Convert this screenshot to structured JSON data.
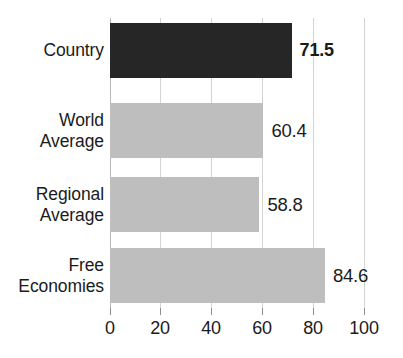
{
  "chart_data": {
    "type": "bar",
    "orientation": "horizontal",
    "title": "",
    "subtitle": "",
    "xlabel": "",
    "ylabel": "",
    "xlim": [
      0,
      100
    ],
    "grid": true,
    "legend": "none",
    "categories": [
      "Country",
      "World\nAverage",
      "Regional\nAverage",
      "Free\nEconomies"
    ],
    "values": [
      71.5,
      60.4,
      58.8,
      84.6
    ],
    "value_labels": [
      "71.5",
      "60.4",
      "58.8",
      "84.6"
    ],
    "tick_values": [
      0,
      20,
      40,
      60,
      80,
      100
    ],
    "tick_labels": [
      "0",
      "20",
      "40",
      "60",
      "80",
      "100"
    ],
    "bar_colors": [
      "#262626",
      "#bebebe",
      "#bebebe",
      "#bebebe"
    ],
    "highlight_index": 0,
    "colors": {
      "highlight_bar": "#262626",
      "comparison_bar": "#bebebe",
      "gridline": "#d3d3d3",
      "axis_tick": "#8d8d8d",
      "text": "#1b1b1b",
      "background": "#ffffff"
    },
    "bars": [
      {
        "category": "Country",
        "label_line1": "Country",
        "label_line2": "",
        "value": 71.5,
        "value_label": "71.5",
        "color": "#262626",
        "emphasis": true
      },
      {
        "category": "World Average",
        "label_line1": "World",
        "label_line2": "Average",
        "value": 60.4,
        "value_label": "60.4",
        "color": "#bebebe",
        "emphasis": false
      },
      {
        "category": "Regional Average",
        "label_line1": "Regional",
        "label_line2": "Average",
        "value": 58.8,
        "value_label": "58.8",
        "color": "#bebebe",
        "emphasis": false
      },
      {
        "category": "Free Economies",
        "label_line1": "Free",
        "label_line2": "Economies",
        "value": 84.6,
        "value_label": "84.6",
        "color": "#bebebe",
        "emphasis": false
      }
    ]
  }
}
